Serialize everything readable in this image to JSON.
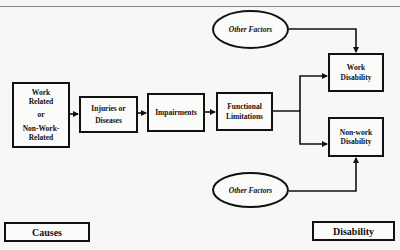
{
  "header": {
    "caption": "Figure ... Disability Model"
  },
  "diagram": {
    "nodes": {
      "causes_box": {
        "lines": [
          "Work",
          "Related",
          "or",
          "Non-Work-",
          "Related"
        ]
      },
      "injuries": {
        "lines": [
          "Injuries or",
          "Diseases"
        ]
      },
      "impairments": {
        "lines": [
          "Impairments"
        ]
      },
      "functional": {
        "lines": [
          "Functional",
          "Limitations"
        ]
      },
      "work_disability": {
        "lines": [
          "Work",
          "Disability"
        ]
      },
      "nonwork_disability": {
        "lines": [
          "Non-work",
          "Disability"
        ]
      },
      "other_factors_top": {
        "label": "Other Factors"
      },
      "other_factors_bottom": {
        "label": "Other Factors"
      }
    },
    "section_labels": {
      "left": "Causes",
      "right": "Disability"
    },
    "edges": [
      {
        "from": "causes_box",
        "to": "injuries"
      },
      {
        "from": "injuries",
        "to": "impairments"
      },
      {
        "from": "impairments",
        "to": "functional"
      },
      {
        "from": "functional",
        "to": "work_disability"
      },
      {
        "from": "functional",
        "to": "nonwork_disability"
      },
      {
        "from": "other_factors_top",
        "to": "work_disability"
      },
      {
        "from": "other_factors_bottom",
        "to": "nonwork_disability"
      }
    ]
  }
}
